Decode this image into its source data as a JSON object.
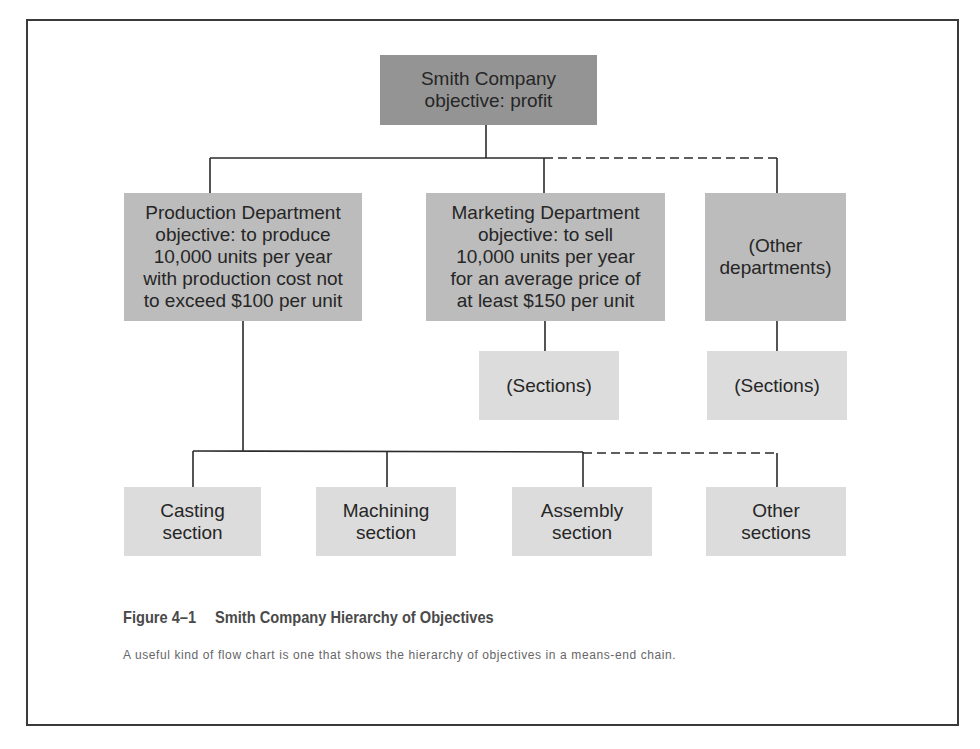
{
  "diagram": {
    "type": "hierarchy",
    "root": {
      "label": "Smith Company\nobjective: profit"
    },
    "departments": [
      {
        "label": "Production Department\nobjective: to produce\n10,000 units per year\nwith production cost not\nto exceed $100 per unit"
      },
      {
        "label": "Marketing Department\nobjective: to sell\n10,000 units per year\nfor an average price of\nat least $150 per unit"
      },
      {
        "label": "(Other\ndepartments)"
      }
    ],
    "department_sections": [
      {
        "parent": "Marketing Department",
        "label": "(Sections)"
      },
      {
        "parent": "Other departments",
        "label": "(Sections)"
      }
    ],
    "production_sections": [
      {
        "label": "Casting\nsection"
      },
      {
        "label": "Machining\nsection"
      },
      {
        "label": "Assembly\nsection"
      },
      {
        "label": "Other\nsections"
      }
    ],
    "connectors": {
      "solid": "root to Production and Marketing; Production to Casting, Machining, Assembly",
      "dashed": "to Other departments; to Other sections"
    }
  },
  "caption": {
    "figure_number": "Figure 4–1",
    "title": "Smith Company Hierarchy of Objectives",
    "description": "A useful kind of flow chart is one that shows the hierarchy of objectives in a means-end chain."
  },
  "colors": {
    "root_fill": "#949494",
    "department_fill": "#bcbcbc",
    "section_fill": "#dcdcdc",
    "line": "#2a2a2a"
  }
}
